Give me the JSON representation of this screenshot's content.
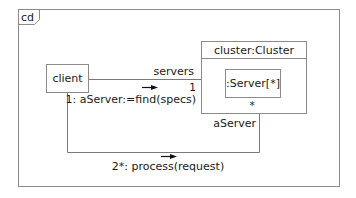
{
  "diagram": {
    "frame": {
      "tag": "cd"
    },
    "nodes": [
      {
        "id": "client",
        "label": "client"
      },
      {
        "id": "cluster",
        "label": "cluster:Cluster"
      },
      {
        "id": "server",
        "label": ":Server[*]"
      }
    ],
    "links": [
      {
        "id": "client-cluster",
        "role": "servers",
        "multiplicity": "1",
        "message": "1: aServer:=find(specs)"
      },
      {
        "id": "client-server",
        "role": "aServer",
        "multiplicity": "*",
        "message": "2*: process(request)"
      }
    ],
    "colors": {
      "stroke": "#808080",
      "text": "#1a1a1a",
      "background": "#ffffff"
    }
  }
}
